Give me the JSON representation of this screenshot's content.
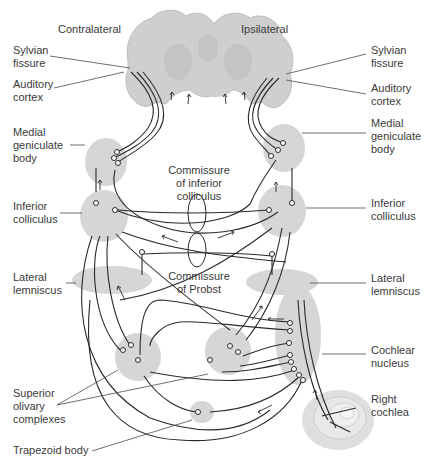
{
  "diagram": {
    "sides": {
      "left": "Contralateral",
      "right": "Ipsilateral"
    },
    "labels_left": {
      "sylvian_fissure": "Sylvian\nfissure",
      "auditory_cortex": "Auditory\ncortex",
      "medial_geniculate_body": "Medial\ngeniculate\nbody",
      "inferior_colliculus": "Inferior\ncolliculus",
      "lateral_lemniscus": "Lateral\nlemniscus",
      "superior_olivary_complexes": "Superior\nolivary\ncomplexes",
      "trapezoid_body": "Trapezoid body"
    },
    "labels_right": {
      "sylvian_fissure": "Sylvian\nfissure",
      "auditory_cortex": "Auditory\ncortex",
      "medial_geniculate_body": "Medial\ngeniculate\nbody",
      "inferior_colliculus": "Inferior\ncolliculus",
      "lateral_lemniscus": "Lateral\nlemniscus",
      "cochlear_nucleus": "Cochlear\nnucleus",
      "right_cochlea": "Right\ncochlea"
    },
    "labels_center": {
      "commissure_inferior_colliculus": "Commissure\nof inferior\ncolliculus",
      "commissure_of_probst": "Commissure\nof Probst"
    },
    "colors": {
      "region_fill": "#d6d6d6",
      "brain_fill": "#cfcfcf",
      "line": "#2a2a2a",
      "text": "#3a3a3a",
      "background": "#ffffff"
    }
  }
}
